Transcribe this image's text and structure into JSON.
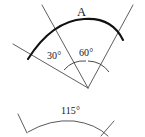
{
  "figure": {
    "background_color": "#ffffff",
    "stroke_color": "#4c4c4c",
    "bold_stroke_color": "#111111",
    "top_diagram": {
      "vertex_label": "A",
      "angle_labels": [
        {
          "name": "left-angle",
          "text": "30°",
          "value": 30,
          "unit": "degrees"
        },
        {
          "name": "right-angle",
          "text": "60°",
          "value": 60,
          "unit": "degrees"
        }
      ],
      "total_angle_text": "90°",
      "ray_count": 3,
      "arc_style": "bold-outer-arc"
    },
    "bottom_diagram": {
      "angle_labels": [
        {
          "name": "main-angle",
          "text": "115°",
          "value": 115,
          "unit": "degrees"
        }
      ],
      "ray_count": 2,
      "arc_style": "thin-outer-arc"
    }
  }
}
